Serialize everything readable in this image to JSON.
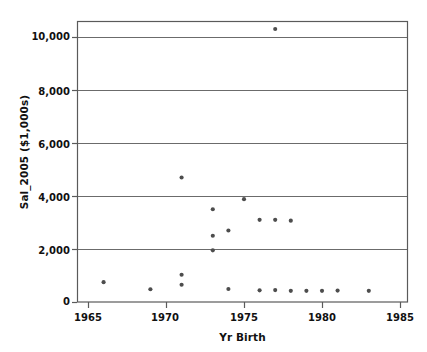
{
  "chart_data": {
    "type": "scatter",
    "title": "",
    "xlabel": "Yr  Birth",
    "ylabel": "Sal_2005 ($1,000s)",
    "xlim": [
      1964,
      1985
    ],
    "ylim": [
      0,
      10600
    ],
    "xticks": [
      1965,
      1970,
      1975,
      1980,
      1985
    ],
    "xtick_labels": [
      "1965",
      "1970",
      "1975",
      "1980",
      "1985"
    ],
    "yticks": [
      0,
      2000,
      4000,
      6000,
      8000,
      10000
    ],
    "ytick_labels": [
      "0",
      "2,000",
      "4,000",
      "6,000",
      "8,000",
      "10,000"
    ],
    "grid": "horizontal",
    "legend": "none",
    "marker": {
      "shape": "circle",
      "color": "#4d4d4d",
      "size": 3
    },
    "points": [
      {
        "x": 1966,
        "y": 750
      },
      {
        "x": 1969,
        "y": 480
      },
      {
        "x": 1971,
        "y": 1030
      },
      {
        "x": 1971,
        "y": 650
      },
      {
        "x": 1971,
        "y": 4700
      },
      {
        "x": 1973,
        "y": 3500
      },
      {
        "x": 1973,
        "y": 2500
      },
      {
        "x": 1973,
        "y": 1950
      },
      {
        "x": 1974,
        "y": 2700
      },
      {
        "x": 1974,
        "y": 490
      },
      {
        "x": 1975,
        "y": 3880
      },
      {
        "x": 1976,
        "y": 3100
      },
      {
        "x": 1976,
        "y": 440
      },
      {
        "x": 1977,
        "y": 10300
      },
      {
        "x": 1977,
        "y": 3100
      },
      {
        "x": 1977,
        "y": 450
      },
      {
        "x": 1978,
        "y": 3070
      },
      {
        "x": 1978,
        "y": 420
      },
      {
        "x": 1979,
        "y": 420
      },
      {
        "x": 1980,
        "y": 420
      },
      {
        "x": 1981,
        "y": 430
      },
      {
        "x": 1983,
        "y": 420
      }
    ]
  },
  "colors": {
    "frame": "#5a5a5a",
    "gridline": "#6b6b6b",
    "marker": "#4d4d4d",
    "text": "#111111",
    "background": "#ffffff"
  }
}
